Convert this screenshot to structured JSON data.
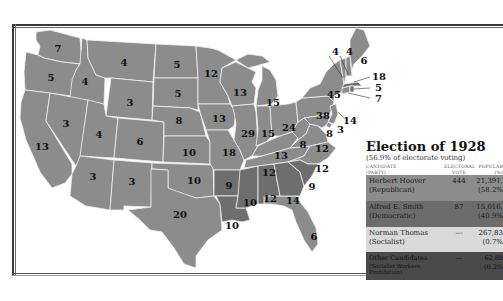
{
  "legend": {
    "title": "Election of 1928",
    "subtitle": "(56.9% of electorate voting)",
    "columns": {
      "candidate": "CANDIDATE (PARTY)",
      "electoral": "ELECTORAL VOTE",
      "popular": "POPULAR (%)"
    },
    "column_lines": {
      "candidate_1": "CANDIDATE",
      "candidate_2": "(PARTY)",
      "electoral_1": "ELECTORAL",
      "electoral_2": "VOTE",
      "popular_1": "POPULAR",
      "popular_2": "(%)"
    },
    "rows": [
      {
        "name": "Herbert Hoover",
        "party": "(Republican)",
        "electoral": "444",
        "popular": "21,391,",
        "percent": "(58.2%",
        "color": "#8c8c8c"
      },
      {
        "name": "Alfred E. Smith",
        "party": "(Democratic)",
        "electoral": "87",
        "popular": "15,016,",
        "percent": "(40.9%",
        "color": "#6c6c6c"
      },
      {
        "name": "Norman Thomas",
        "party": "(Socialist)",
        "electoral": "---",
        "popular": "267,83",
        "percent": "(0.7%",
        "color": "#d9d9d9"
      },
      {
        "name": "Other Candidates",
        "party": "(Socialist Workers,",
        "party2": "Prohibition)",
        "electoral": "---",
        "popular": "62,89",
        "percent": "(0.2%",
        "color": "#4a4a4a"
      }
    ]
  },
  "map": {
    "colors": {
      "republican": "#8c8c8c",
      "democratic": "#6e6e6e",
      "border": "#f0f0f0"
    },
    "state_labels": [
      {
        "state": "WA",
        "votes": "7"
      },
      {
        "state": "OR",
        "votes": "5"
      },
      {
        "state": "ID",
        "votes": "4"
      },
      {
        "state": "MT",
        "votes": "4"
      },
      {
        "state": "ND",
        "votes": "5"
      },
      {
        "state": "MN",
        "votes": "12"
      },
      {
        "state": "WY",
        "votes": "3"
      },
      {
        "state": "SD",
        "votes": "5"
      },
      {
        "state": "WI",
        "votes": "13"
      },
      {
        "state": "MI",
        "votes": "15"
      },
      {
        "state": "NV",
        "votes": "3"
      },
      {
        "state": "UT",
        "votes": "4"
      },
      {
        "state": "CO",
        "votes": "6"
      },
      {
        "state": "NE",
        "votes": "8"
      },
      {
        "state": "IA",
        "votes": "13"
      },
      {
        "state": "IL",
        "votes": "29"
      },
      {
        "state": "IN",
        "votes": "15"
      },
      {
        "state": "OH",
        "votes": "24"
      },
      {
        "state": "PA",
        "votes": "38"
      },
      {
        "state": "NY",
        "votes": "45"
      },
      {
        "state": "CA",
        "votes": "13"
      },
      {
        "state": "KS",
        "votes": "10"
      },
      {
        "state": "MO",
        "votes": "18"
      },
      {
        "state": "KY",
        "votes": "13"
      },
      {
        "state": "WV",
        "votes": "8"
      },
      {
        "state": "VA",
        "votes": "12"
      },
      {
        "state": "AZ",
        "votes": "3"
      },
      {
        "state": "NM",
        "votes": "3"
      },
      {
        "state": "OK",
        "votes": "10"
      },
      {
        "state": "AR",
        "votes": "9"
      },
      {
        "state": "TN",
        "votes": "12"
      },
      {
        "state": "NC",
        "votes": "12"
      },
      {
        "state": "TX",
        "votes": "20"
      },
      {
        "state": "LA",
        "votes": "10"
      },
      {
        "state": "MS",
        "votes": "10"
      },
      {
        "state": "AL",
        "votes": "12"
      },
      {
        "state": "GA",
        "votes": "14"
      },
      {
        "state": "SC",
        "votes": "9"
      },
      {
        "state": "FL",
        "votes": "6"
      },
      {
        "state": "ME",
        "votes": "6"
      },
      {
        "state": "VT",
        "votes": "4"
      },
      {
        "state": "NH",
        "votes": "4"
      },
      {
        "state": "MA",
        "votes": "18"
      },
      {
        "state": "RI",
        "votes": "5"
      },
      {
        "state": "CT",
        "votes": "7"
      },
      {
        "state": "NJ",
        "votes": "14"
      },
      {
        "state": "DE",
        "votes": "3"
      },
      {
        "state": "MD",
        "votes": "8"
      }
    ]
  }
}
